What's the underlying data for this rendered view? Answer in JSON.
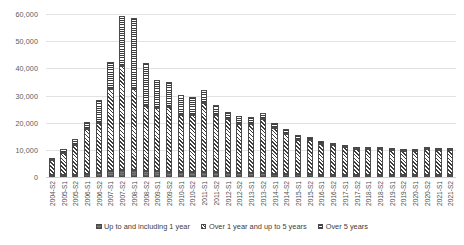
{
  "chart_data": {
    "type": "bar",
    "stacked": true,
    "title": "",
    "xlabel": "",
    "ylabel": "",
    "ylim": [
      0,
      60000
    ],
    "yticks": [
      0,
      10000,
      20000,
      30000,
      40000,
      50000,
      60000
    ],
    "ytick_labels": [
      "0",
      "10,000",
      "20,000",
      "30,000",
      "40,000",
      "50,000",
      "60,000"
    ],
    "grid": true,
    "legend_position": "bottom",
    "categories": [
      "2004-S2",
      "2005-S1",
      "2005-S2",
      "2006-S1",
      "2006-S2",
      "2007-S1",
      "2007-S2",
      "2008-S1",
      "2008-S2",
      "2009-S1",
      "2009-S2",
      "2010-S1",
      "2010-S2",
      "2011-S1",
      "2011-S2",
      "2012-S1",
      "2012-S2",
      "2013-S1",
      "2013-S2",
      "2014-S1",
      "2014-S2",
      "2015-S1",
      "2015-S2",
      "2016-S1",
      "2016-S2",
      "2017-S1",
      "2017-S2",
      "2018-S1",
      "2018-S2",
      "2019-S1",
      "2019-S2",
      "2020-S1",
      "2020-S2",
      "2021-S1",
      "2021-S2"
    ],
    "series": [
      {
        "name": "Up to and including 1 year",
        "pattern": "solid-grey",
        "values": [
          600,
          700,
          900,
          1100,
          1400,
          2100,
          2600,
          2600,
          2300,
          2100,
          2000,
          1900,
          1800,
          1900,
          1700,
          1600,
          1500,
          1400,
          1300,
          1200,
          1100,
          1000,
          950,
          900,
          850,
          800,
          780,
          760,
          740,
          720,
          700,
          690,
          680,
          670,
          660
        ]
      },
      {
        "name": "Over 1 year and up to 5 years",
        "pattern": "diagonal-hatch",
        "values": [
          5500,
          8200,
          10900,
          16500,
          18400,
          30300,
          38400,
          29900,
          24000,
          23200,
          23600,
          20900,
          21200,
          25300,
          21100,
          19600,
          18200,
          18300,
          20100,
          16700,
          14700,
          12800,
          12600,
          11300,
          10800,
          10300,
          9600,
          9500,
          9400,
          9200,
          9000,
          8900,
          9400,
          9300,
          9300
        ]
      },
      {
        "name": "Over 5 years",
        "pattern": "horizontal-lines",
        "values": [
          600,
          1400,
          2300,
          2600,
          8500,
          9800,
          18100,
          25900,
          15500,
          10500,
          9400,
          7300,
          6400,
          5000,
          3800,
          2900,
          2700,
          2400,
          2100,
          1900,
          1700,
          1500,
          1200,
          1000,
          900,
          850,
          800,
          780,
          760,
          740,
          720,
          700,
          700,
          690,
          690
        ]
      }
    ],
    "totals": [
      6700,
      10300,
      14100,
      20200,
      28300,
      42200,
      59100,
      58400,
      41800,
      35800,
      35000,
      30100,
      29400,
      32200,
      26600,
      24100,
      22400,
      22100,
      23500,
      19800,
      17500,
      15300,
      14750,
      13200,
      12550,
      11950,
      11180,
      10740,
      10900,
      10660,
      10420,
      10290,
      10780,
      10660,
      10650
    ]
  },
  "legend": {
    "items": [
      {
        "label": "Up to and including 1 year"
      },
      {
        "label": "Over 1 year and up to 5 years"
      },
      {
        "label": "Over 5 years"
      }
    ]
  }
}
